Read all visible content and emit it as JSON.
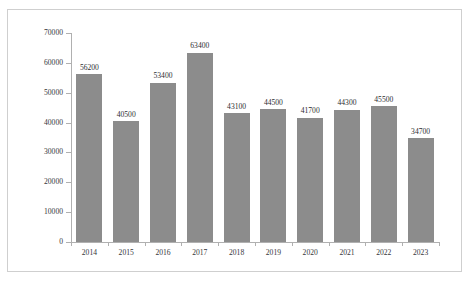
{
  "page": {
    "clipped_header_text": "·   ·                                  ·            ·                       ·      ·"
  },
  "chart_data": {
    "type": "bar",
    "title": "",
    "xlabel": "",
    "ylabel": "",
    "categories": [
      "2014",
      "2015",
      "2016",
      "2017",
      "2018",
      "2019",
      "2020",
      "2021",
      "2022",
      "2023"
    ],
    "values": [
      56200,
      40500,
      53400,
      63400,
      43100,
      44500,
      41700,
      44300,
      45500,
      34700
    ],
    "value_labels": [
      "56200",
      "40500",
      "53400",
      "63400",
      "43100",
      "44500",
      "41700",
      "44300",
      "45500",
      "34700"
    ],
    "ylim": [
      0,
      70000
    ],
    "ytick_values": [
      0,
      10000,
      20000,
      30000,
      40000,
      50000,
      60000,
      70000
    ],
    "ytick_labels": [
      "0",
      "10000",
      "20000",
      "30000",
      "40000",
      "50000",
      "60000",
      "70000"
    ],
    "grid": false,
    "legend": null,
    "bar_color": "#8c8c8c",
    "axis_color": "#b0b0b0",
    "text_color": "#35353a",
    "background": "#ffffff"
  }
}
